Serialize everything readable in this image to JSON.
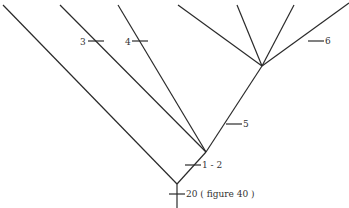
{
  "diagram": {
    "type": "cladogram",
    "colors": {
      "line": "#2a2a2a",
      "text": "#333333",
      "background": "#ffffff"
    },
    "nodes": [
      {
        "id": "root",
        "x": 177,
        "y": 184
      },
      {
        "id": "node-a",
        "x": 206,
        "y": 152
      },
      {
        "id": "node-b",
        "x": 262,
        "y": 66
      }
    ],
    "branches": [
      {
        "id": "stem",
        "from": [
          177,
          208
        ],
        "to": [
          177,
          184
        ]
      },
      {
        "id": "leaf-1",
        "from": [
          177,
          184
        ],
        "to": [
          3,
          5
        ]
      },
      {
        "id": "root-to-a",
        "from": [
          177,
          184
        ],
        "to": [
          206,
          152
        ]
      },
      {
        "id": "leaf-3",
        "from": [
          206,
          152
        ],
        "to": [
          60,
          5
        ]
      },
      {
        "id": "leaf-4",
        "from": [
          206,
          152
        ],
        "to": [
          118,
          5
        ]
      },
      {
        "id": "a-to-b",
        "from": [
          206,
          152
        ],
        "to": [
          262,
          66
        ]
      },
      {
        "id": "leaf-5",
        "from": [
          262,
          66
        ],
        "to": [
          178,
          5
        ]
      },
      {
        "id": "leaf-6",
        "from": [
          262,
          66
        ],
        "to": [
          237,
          5
        ]
      },
      {
        "id": "leaf-7",
        "from": [
          262,
          66
        ],
        "to": [
          294,
          5
        ]
      },
      {
        "id": "leaf-8",
        "from": [
          262,
          66
        ],
        "to": [
          349,
          3
        ]
      }
    ],
    "characters": [
      {
        "id": "char-20",
        "label": "20 ( figure 40 )",
        "tick_x": 177,
        "tick_y": 194,
        "label_x": 186,
        "label_y": 197,
        "side": "right"
      },
      {
        "id": "char-1-2",
        "label": "1 - 2",
        "tick_x": 193,
        "tick_y": 165,
        "label_x": 202,
        "label_y": 168,
        "side": "right"
      },
      {
        "id": "char-5",
        "label": "5",
        "tick_x": 234,
        "tick_y": 124,
        "label_x": 243,
        "label_y": 127,
        "side": "right"
      },
      {
        "id": "char-3",
        "label": "3",
        "tick_x": 96,
        "tick_y": 41,
        "label_x": 80,
        "label_y": 45,
        "side": "left"
      },
      {
        "id": "char-4",
        "label": "4",
        "tick_x": 140,
        "tick_y": 41,
        "label_x": 125,
        "label_y": 45,
        "side": "left"
      },
      {
        "id": "char-6",
        "label": "6",
        "tick_x": 316,
        "tick_y": 41,
        "label_x": 325,
        "label_y": 44,
        "side": "right"
      }
    ]
  }
}
